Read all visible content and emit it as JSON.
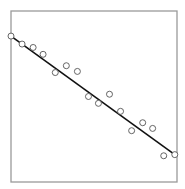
{
  "chart_data": {
    "type": "scatter",
    "title": "",
    "xlabel": "",
    "ylabel": "",
    "xlim": [
      0,
      15
    ],
    "ylim": [
      0,
      15
    ],
    "grid": false,
    "legend": "none",
    "series": [
      {
        "name": "observations",
        "marker": "open-circle",
        "points": [
          [
            0.0,
            12.8
          ],
          [
            1.0,
            12.1
          ],
          [
            2.0,
            11.8
          ],
          [
            2.9,
            11.2
          ],
          [
            4.0,
            9.6
          ],
          [
            5.0,
            10.2
          ],
          [
            6.0,
            9.7
          ],
          [
            7.0,
            7.5
          ],
          [
            7.9,
            6.9
          ],
          [
            8.9,
            7.7
          ],
          [
            9.9,
            6.2
          ],
          [
            10.9,
            4.5
          ],
          [
            11.9,
            5.2
          ],
          [
            12.8,
            4.7
          ],
          [
            13.8,
            2.3
          ],
          [
            14.8,
            2.4
          ]
        ]
      }
    ],
    "fit_line": {
      "name": "regression line",
      "from": [
        0.0,
        12.8
      ],
      "to": [
        14.8,
        2.4
      ]
    },
    "colors": {
      "frame": "#9a9a9a",
      "line": "#111111",
      "marker_stroke": "#555555",
      "marker_fill": "#ffffff"
    }
  }
}
